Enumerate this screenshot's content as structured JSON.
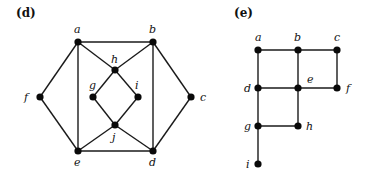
{
  "panels": [
    {
      "label": "(d)",
      "label_pos": [
        16,
        17
      ],
      "nodes": [
        {
          "id": "a",
          "x": 78,
          "y": 42,
          "lx": 74,
          "ly": 33,
          "label": "a"
        },
        {
          "id": "b",
          "x": 153,
          "y": 42,
          "lx": 149,
          "ly": 33,
          "label": "b"
        },
        {
          "id": "h",
          "x": 115,
          "y": 70,
          "lx": 111,
          "ly": 63,
          "label": "h"
        },
        {
          "id": "g",
          "x": 93,
          "y": 97,
          "lx": 89,
          "ly": 89,
          "label": "g"
        },
        {
          "id": "i",
          "x": 138,
          "y": 97,
          "lx": 135,
          "ly": 89,
          "label": "i"
        },
        {
          "id": "f",
          "x": 40,
          "y": 97,
          "lx": 24,
          "ly": 101,
          "label": "f"
        },
        {
          "id": "c",
          "x": 191,
          "y": 97,
          "lx": 200,
          "ly": 101,
          "label": "c"
        },
        {
          "id": "j",
          "x": 115,
          "y": 125,
          "lx": 112,
          "ly": 141,
          "label": "j"
        },
        {
          "id": "e",
          "x": 78,
          "y": 151,
          "lx": 74,
          "ly": 166,
          "label": "e"
        },
        {
          "id": "d",
          "x": 153,
          "y": 151,
          "lx": 149,
          "ly": 166,
          "label": "d"
        }
      ],
      "edges": [
        [
          "a",
          "b"
        ],
        [
          "a",
          "f"
        ],
        [
          "a",
          "e"
        ],
        [
          "a",
          "h"
        ],
        [
          "b",
          "h"
        ],
        [
          "b",
          "d"
        ],
        [
          "b",
          "c"
        ],
        [
          "h",
          "g"
        ],
        [
          "h",
          "i"
        ],
        [
          "g",
          "j"
        ],
        [
          "i",
          "j"
        ],
        [
          "j",
          "e"
        ],
        [
          "j",
          "d"
        ],
        [
          "f",
          "e"
        ],
        [
          "e",
          "d"
        ],
        [
          "c",
          "d"
        ]
      ]
    },
    {
      "label": "(e)",
      "label_pos": [
        234,
        17
      ],
      "nodes": [
        {
          "id": "a",
          "x": 258,
          "y": 50,
          "lx": 255,
          "ly": 41,
          "label": "a"
        },
        {
          "id": "b",
          "x": 298,
          "y": 50,
          "lx": 294,
          "ly": 41,
          "label": "b"
        },
        {
          "id": "c",
          "x": 337,
          "y": 50,
          "lx": 334,
          "ly": 41,
          "label": "c"
        },
        {
          "id": "d",
          "x": 258,
          "y": 88,
          "lx": 244,
          "ly": 92,
          "label": "d"
        },
        {
          "id": "e",
          "x": 298,
          "y": 88,
          "lx": 307,
          "ly": 83,
          "label": "e"
        },
        {
          "id": "f",
          "x": 337,
          "y": 88,
          "lx": 346,
          "ly": 92,
          "label": "f"
        },
        {
          "id": "g",
          "x": 258,
          "y": 126,
          "lx": 244,
          "ly": 130,
          "label": "g"
        },
        {
          "id": "h",
          "x": 298,
          "y": 126,
          "lx": 306,
          "ly": 130,
          "label": "h"
        },
        {
          "id": "i",
          "x": 258,
          "y": 164,
          "lx": 246,
          "ly": 168,
          "label": "i"
        }
      ],
      "edges": [
        [
          "a",
          "b"
        ],
        [
          "b",
          "c"
        ],
        [
          "a",
          "d"
        ],
        [
          "b",
          "e"
        ],
        [
          "c",
          "f"
        ],
        [
          "d",
          "e"
        ],
        [
          "e",
          "f"
        ],
        [
          "d",
          "g"
        ],
        [
          "e",
          "h"
        ],
        [
          "g",
          "h"
        ],
        [
          "g",
          "i"
        ]
      ]
    }
  ]
}
